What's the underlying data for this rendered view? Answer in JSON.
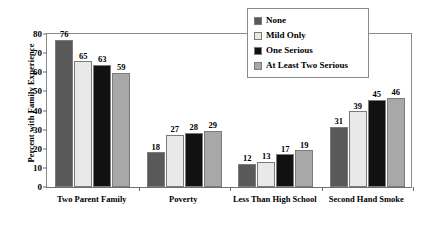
{
  "chart_data": {
    "type": "bar",
    "title": "",
    "xlabel": "",
    "ylabel": "Percent with Family Experience",
    "ylim": [
      0,
      80
    ],
    "yticks": [
      0,
      10,
      20,
      30,
      40,
      50,
      60,
      70,
      80
    ],
    "ytick_labels": [
      "0",
      "10",
      "20",
      "30",
      "40",
      "50",
      "60",
      "70",
      "80"
    ],
    "grid": false,
    "legend_position": "top-right",
    "categories": [
      "Two Parent Family",
      "Poverty",
      "Less Than High School",
      "Second Hand Smoke"
    ],
    "series": [
      {
        "name": "None",
        "color": "#595959",
        "values": [
          76,
          18,
          12,
          31
        ]
      },
      {
        "name": "Mild Only",
        "color": "#e9e9e9",
        "values": [
          65,
          27,
          13,
          39
        ]
      },
      {
        "name": "One Serious",
        "color": "#111111",
        "values": [
          63,
          28,
          17,
          45
        ]
      },
      {
        "name": "At Least Two Serious",
        "color": "#a8a8a8",
        "values": [
          59,
          29,
          19,
          46
        ]
      }
    ]
  },
  "legend": {
    "entries": [
      {
        "label": "None"
      },
      {
        "label": "Mild Only"
      },
      {
        "label": "One Serious"
      },
      {
        "label": "At Least Two Serious"
      }
    ]
  }
}
